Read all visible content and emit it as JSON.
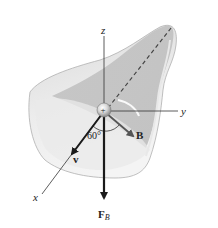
{
  "figure": {
    "axes": {
      "z_label": "z",
      "y_label": "y",
      "x_label": "x"
    },
    "charge_label": "+",
    "vectors": {
      "velocity_label": "v",
      "field_label": "B",
      "force_label": "F",
      "force_subscript": "B"
    },
    "angle_label": "60°",
    "colors": {
      "surface_light": "#e6e6e6",
      "surface_mid": "#cfcfcf",
      "surface_dark": "#b9b9b9",
      "axis": "#333333",
      "vector": "#1a1a1a",
      "field_vector": "#555555",
      "dashed": "#444444"
    }
  }
}
